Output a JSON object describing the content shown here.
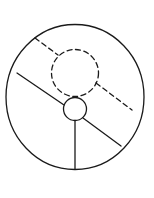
{
  "diagram": {
    "width": 154,
    "height": 198,
    "stroke_color": "#1a1a1a",
    "background": "#ffffff",
    "outer_circle": {
      "cx": 75,
      "cy": 97,
      "rx": 69,
      "ry": 72.5,
      "style": "solid"
    },
    "dashed_circle": {
      "cx": 75,
      "cy": 73,
      "r": 23.5,
      "style": "dashed"
    },
    "small_circle": {
      "cx": 75,
      "cy": 109,
      "r": 11.5,
      "style": "solid"
    },
    "solid_line_left": {
      "x1": 17,
      "y1": 73,
      "x2": 64,
      "y2": 105,
      "style": "solid"
    },
    "solid_line_right": {
      "x1": 83,
      "y1": 118,
      "x2": 121,
      "y2": 146,
      "style": "solid"
    },
    "vertical_line": {
      "x1": 75,
      "y1": 120.5,
      "x2": 75,
      "y2": 169,
      "style": "solid"
    },
    "dashed_line_upper": {
      "x1": 35,
      "y1": 38,
      "x2": 58,
      "y2": 55,
      "style": "dashed"
    },
    "dashed_line_lower": {
      "x1": 96,
      "y1": 83,
      "x2": 132,
      "y2": 110,
      "style": "dashed"
    }
  }
}
